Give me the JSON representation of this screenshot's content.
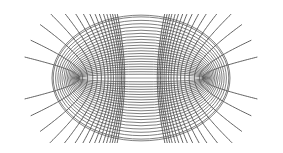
{
  "figure": {
    "title": "",
    "canvas": {
      "width": 283,
      "height": 153,
      "background": "#ffffff"
    },
    "center": {
      "x": 141,
      "y": 78
    },
    "focal_distance": 63,
    "y_scale": 1.0,
    "colors": {
      "ellipse": "#555555",
      "hyperbola": "#505050"
    },
    "ellipses": {
      "mu_values": [
        0.06,
        0.1,
        0.14,
        0.18,
        0.22,
        0.26,
        0.3,
        0.34,
        0.38,
        0.42,
        0.46,
        0.5,
        0.54,
        0.58,
        0.62,
        0.66,
        0.7,
        0.74,
        0.78,
        0.82,
        0.86,
        0.88
      ]
    },
    "hyperbolas": {
      "nu_degrees": [
        12,
        22,
        32,
        40,
        46,
        51,
        55,
        58.5,
        61.5,
        64,
        66.5,
        68.5,
        70.5,
        72,
        73.5,
        75
      ],
      "mu_max": 1.25,
      "clip": {
        "x_min": 15,
        "x_max": 270,
        "y_min": 14,
        "y_max": 143
      }
    }
  }
}
